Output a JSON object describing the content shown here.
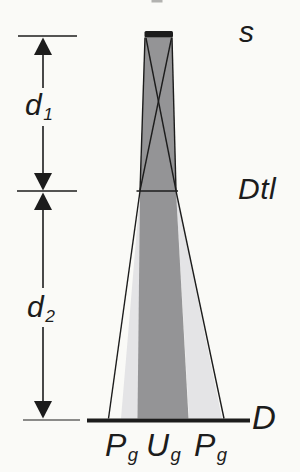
{
  "labels": {
    "source": "s",
    "detail": "Dtl",
    "detector": "D",
    "d1": {
      "base": "d",
      "sub": "1"
    },
    "d2": {
      "base": "d",
      "sub": "2"
    },
    "penumbra_left": {
      "base": "P",
      "sub": "g"
    },
    "umbra": {
      "base": "U",
      "sub": "g"
    },
    "penumbra_right": {
      "base": "P",
      "sub": "g"
    }
  },
  "colors": {
    "background": "#fafaf7",
    "ink": "#1c1c1c",
    "umbra_fill": "#949496",
    "penumbra_fill": "#e4e4e6",
    "artifact": "#a0a09e"
  }
}
